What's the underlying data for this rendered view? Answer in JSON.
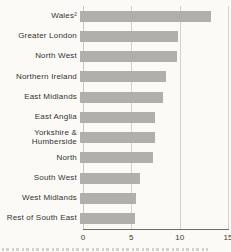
{
  "chart_data": {
    "type": "bar",
    "orientation": "horizontal",
    "title": "",
    "xlabel": "",
    "ylabel": "",
    "categories": [
      "Wales²",
      "Greater London",
      "North West",
      "Northern Ireland",
      "East Midlands",
      "East Anglia",
      "Yorkshire &\nHumberside",
      "North",
      "South West",
      "West Midlands",
      "Rest of South East"
    ],
    "values": [
      13.5,
      10.1,
      10.0,
      8.9,
      8.6,
      7.8,
      7.8,
      7.5,
      6.2,
      5.8,
      5.7
    ],
    "xlim": [
      0,
      15
    ],
    "x_ticks": [
      "0",
      "5",
      "10",
      "15"
    ],
    "x_tick_values": [
      0,
      5,
      10,
      15
    ],
    "grid": "vertical",
    "legend": "none",
    "footnote_marker_on_first_category": "2"
  },
  "colors": {
    "background": "#fbfaf7",
    "bar": "#b1afac",
    "gridline": "#d3d1cc",
    "axis_line": "#6f6d69",
    "text": "#35332f"
  }
}
